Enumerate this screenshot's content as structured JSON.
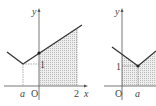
{
  "left_graph": {
    "y_axis_label": "y",
    "x_axis_label": "x",
    "origin_label": "O",
    "a_label": "a",
    "one_label": "1",
    "two_label": "2"
  },
  "right_graph": {
    "y_axis_label": "y",
    "origin_label": "O",
    "a_label": "a",
    "one_label": "1"
  },
  "colors": {
    "line": "#333333",
    "shade": "#d8d8d8",
    "axis": "#555555"
  }
}
